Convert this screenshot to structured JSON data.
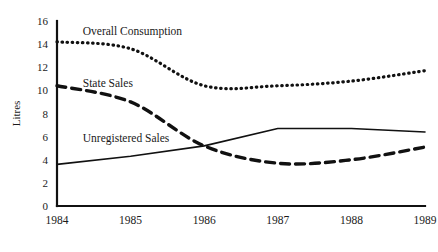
{
  "chart_data": {
    "type": "line",
    "title": "",
    "xlabel": "",
    "ylabel": "Litres",
    "x": [
      1984,
      1985,
      1986,
      1987,
      1988,
      1989
    ],
    "xtick_labels": [
      "1984",
      "1985",
      "1986",
      "1987",
      "1988",
      "1989"
    ],
    "ytick_labels": [
      "0",
      "2",
      "4",
      "6",
      "8",
      "10",
      "12",
      "14",
      "16"
    ],
    "ytick_values": [
      0,
      2,
      4,
      6,
      8,
      10,
      12,
      14,
      16
    ],
    "ylim": [
      0,
      16
    ],
    "xlim": [
      1984,
      1989
    ],
    "grid": false,
    "legend": "inline-labels",
    "series": [
      {
        "name": "Overall Consumption",
        "style": "dotted",
        "color": "#111111",
        "values": [
          14.2,
          13.6,
          10.4,
          10.4,
          10.8,
          11.7
        ],
        "label_x": 1984.35,
        "label_y": 15.1
      },
      {
        "name": "State Sales",
        "style": "dashed",
        "color": "#111111",
        "values": [
          10.4,
          9.0,
          5.2,
          3.7,
          4.0,
          5.1
        ],
        "label_x": 1984.35,
        "label_y": 10.6
      },
      {
        "name": "Unregistered Sales",
        "style": "solid",
        "color": "#111111",
        "values": [
          3.6,
          4.3,
          5.2,
          6.7,
          6.7,
          6.4
        ],
        "label_x": 1984.35,
        "label_y": 5.9
      }
    ]
  },
  "axes": {
    "y_axis_title": "Litres",
    "axis_color": "#111111"
  }
}
